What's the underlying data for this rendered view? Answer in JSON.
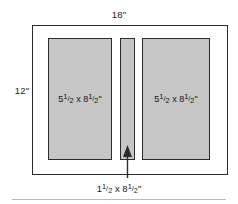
{
  "diagram": {
    "sheet": {
      "width_label": "18\"",
      "height_label": "12\""
    },
    "panels": [
      {
        "id": "left",
        "label_whole_w": "5",
        "label_frac_w_num": "1",
        "label_frac_w_den": "2",
        "label_times": "x",
        "label_whole_h": "8",
        "label_frac_h_num": "1",
        "label_frac_h_den": "2",
        "label_unit": "\"",
        "fill_color": "#c6c6c6"
      },
      {
        "id": "center",
        "label_whole_w": "1",
        "label_frac_w_num": "1",
        "label_frac_w_den": "2",
        "label_times": "x",
        "label_whole_h": "8",
        "label_frac_h_num": "1",
        "label_frac_h_den": "2",
        "label_unit": "\"",
        "fill_color": "#c6c6c6"
      },
      {
        "id": "right",
        "label_whole_w": "5",
        "label_frac_w_num": "1",
        "label_frac_w_den": "2",
        "label_times": "x",
        "label_whole_h": "8",
        "label_frac_h_num": "1",
        "label_frac_h_den": "2",
        "label_unit": "\"",
        "fill_color": "#c6c6c6"
      }
    ],
    "callout": {
      "target": "center-panel",
      "whole_w": "1",
      "frac_w_num": "1",
      "frac_w_den": "2",
      "times": "x",
      "whole_h": "8",
      "frac_h_num": "1",
      "frac_h_den": "2",
      "unit": "\"",
      "arrow_color": "#2b2b2b"
    },
    "colors": {
      "panel_fill": "#c6c6c6",
      "stroke": "#2b2b2b",
      "background": "#ffffff",
      "rule": "#b9b9b9"
    }
  }
}
